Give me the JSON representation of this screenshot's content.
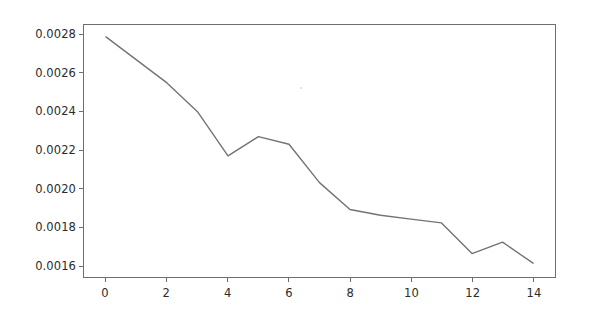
{
  "chart_data": {
    "type": "line",
    "title": "",
    "subtitle": "",
    "xlabel": "",
    "ylabel": "",
    "x": [
      0,
      1,
      2,
      3,
      4,
      5,
      6,
      7,
      8,
      9,
      10,
      11,
      12,
      13,
      14
    ],
    "values": [
      0.00279,
      0.00267,
      0.00255,
      0.0024,
      0.00217,
      0.00227,
      0.00223,
      0.00203,
      0.00189,
      0.00186,
      0.00184,
      0.00182,
      0.00166,
      0.00172,
      0.00161
    ],
    "series": [
      {
        "name": "",
        "values": [
          0.00279,
          0.00267,
          0.00255,
          0.0024,
          0.00217,
          0.00227,
          0.00223,
          0.00203,
          0.00189,
          0.00186,
          0.00184,
          0.00182,
          0.00166,
          0.00172,
          0.00161
        ],
        "color": "#737373"
      }
    ],
    "xlim": [
      -0.72,
      14.72
    ],
    "ylim": [
      0.001538,
      0.002852
    ],
    "xticks": [
      0,
      2,
      4,
      6,
      8,
      10,
      12,
      14
    ],
    "xtick_labels": [
      "0",
      "2",
      "4",
      "6",
      "8",
      "10",
      "12",
      "14"
    ],
    "yticks": [
      0.0016,
      0.0018,
      0.002,
      0.0022,
      0.0024,
      0.0026,
      0.0028
    ],
    "ytick_labels": [
      "0.0016",
      "0.0018",
      "0.0020",
      "0.0022",
      "0.0024",
      "0.0026",
      "0.0028"
    ],
    "grid": false,
    "legend": null,
    "legend_position": "none",
    "annotations": [],
    "line_color": "#737373",
    "line_width": 1.4,
    "axes_color": "#6e6e6e",
    "background_color": "#ffffff",
    "tick_label_color": "#2b2b2b"
  }
}
